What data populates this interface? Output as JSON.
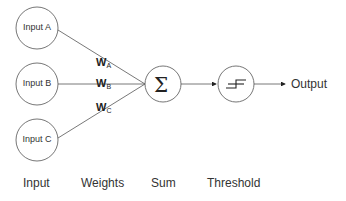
{
  "diagram": {
    "inputs": [
      {
        "label": "Input A",
        "weight": "W",
        "weight_sub": "A"
      },
      {
        "label": "Input B",
        "weight": "W",
        "weight_sub": "B"
      },
      {
        "label": "Input C",
        "weight": "W",
        "weight_sub": "C"
      }
    ],
    "sum_symbol": "Σ",
    "output_label": "Output",
    "stages": [
      "Input",
      "Weights",
      "Sum",
      "Threshold"
    ],
    "colors": {
      "stroke": "#555555",
      "text": "#333333",
      "background": "#ffffff"
    }
  }
}
